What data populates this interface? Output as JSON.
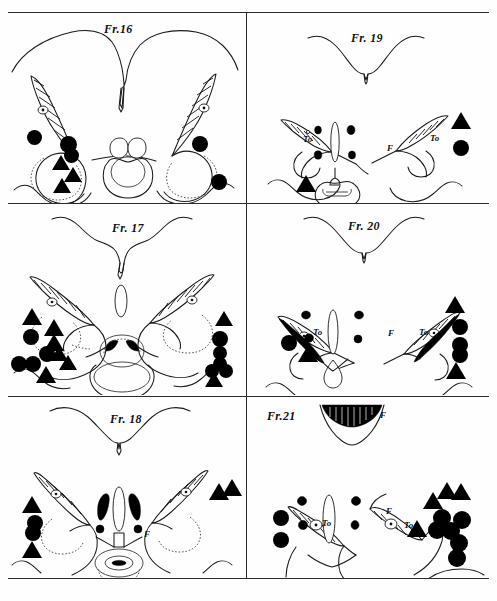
{
  "figure": {
    "title_implicit": "",
    "layout": {
      "columns": 2,
      "rows": 3,
      "width": 497,
      "height": 601
    },
    "colors": {
      "ink": "#1a1a1a",
      "marker": "#000000",
      "paper": "#fefefe"
    }
  },
  "panels": [
    {
      "id": "fr16",
      "title": "Fr.16",
      "title_x": 104,
      "title_y": 22,
      "structure_labels": [],
      "markers": [
        {
          "type": "circle",
          "x": 34,
          "y": 137,
          "r": 7.5
        },
        {
          "type": "circle",
          "x": 68,
          "y": 144,
          "r": 8.5
        },
        {
          "type": "circle",
          "x": 71,
          "y": 155,
          "r": 7.5
        },
        {
          "type": "triangle",
          "x": 61,
          "y": 164,
          "s": 9
        },
        {
          "type": "triangle",
          "x": 73,
          "y": 176,
          "s": 9
        },
        {
          "type": "triangle",
          "x": 62,
          "y": 187,
          "s": 9
        },
        {
          "type": "circle",
          "x": 200,
          "y": 144,
          "r": 8
        },
        {
          "type": "circle",
          "x": 219,
          "y": 182,
          "r": 8
        }
      ]
    },
    {
      "id": "fr19",
      "title": "Fr. 19",
      "title_x": 357,
      "title_y": 32,
      "structure_labels": [
        {
          "text": "To",
          "x": 303,
          "y": 134
        },
        {
          "text": "To",
          "x": 430,
          "y": 133
        },
        {
          "text": "F",
          "x": 387,
          "y": 143
        }
      ],
      "markers": [
        {
          "type": "triangle",
          "x": 306,
          "y": 185,
          "s": 10
        },
        {
          "type": "triangle",
          "x": 461,
          "y": 122,
          "s": 10
        },
        {
          "type": "circle",
          "x": 461,
          "y": 148,
          "r": 8
        }
      ]
    },
    {
      "id": "fr17",
      "title": "Fr. 17",
      "title_x": 112,
      "title_y": 226,
      "structure_labels": [],
      "markers": [
        {
          "type": "triangle",
          "x": 32,
          "y": 318,
          "s": 10
        },
        {
          "type": "triangle",
          "x": 54,
          "y": 329,
          "s": 10
        },
        {
          "type": "circle",
          "x": 31,
          "y": 337,
          "r": 8
        },
        {
          "type": "triangle",
          "x": 54,
          "y": 344,
          "s": 10
        },
        {
          "type": "circle",
          "x": 47,
          "y": 354,
          "r": 8
        },
        {
          "type": "triangle",
          "x": 59,
          "y": 355,
          "s": 9
        },
        {
          "type": "circle",
          "x": 19,
          "y": 364,
          "r": 8
        },
        {
          "type": "circle",
          "x": 33,
          "y": 364,
          "r": 8
        },
        {
          "type": "triangle",
          "x": 68,
          "y": 364,
          "s": 9
        },
        {
          "type": "triangle",
          "x": 46,
          "y": 376,
          "s": 10
        },
        {
          "type": "triangle",
          "x": 224,
          "y": 320,
          "s": 9
        },
        {
          "type": "circle",
          "x": 220,
          "y": 339,
          "r": 8
        },
        {
          "type": "circle",
          "x": 220,
          "y": 353,
          "r": 7
        },
        {
          "type": "circle",
          "x": 220,
          "y": 364,
          "r": 7
        },
        {
          "type": "circle",
          "x": 212,
          "y": 371,
          "r": 7
        },
        {
          "type": "circle",
          "x": 226,
          "y": 371,
          "r": 7
        },
        {
          "type": "triangle",
          "x": 214,
          "y": 381,
          "s": 9
        }
      ]
    },
    {
      "id": "fr20",
      "title": "Fr. 20",
      "title_x": 355,
      "title_y": 226,
      "structure_labels": [
        {
          "text": "To",
          "x": 313,
          "y": 327
        },
        {
          "text": "To",
          "x": 419,
          "y": 327
        },
        {
          "text": "F",
          "x": 388,
          "y": 328
        }
      ],
      "markers": [
        {
          "type": "circle",
          "x": 289,
          "y": 343,
          "r": 8
        },
        {
          "type": "triangle",
          "x": 308,
          "y": 355,
          "s": 10
        },
        {
          "type": "triangle",
          "x": 455,
          "y": 306,
          "s": 10
        },
        {
          "type": "circle",
          "x": 460,
          "y": 327,
          "r": 8
        },
        {
          "type": "circle",
          "x": 460,
          "y": 345,
          "r": 8
        },
        {
          "type": "circle",
          "x": 460,
          "y": 355,
          "r": 8
        },
        {
          "type": "triangle",
          "x": 456,
          "y": 372,
          "s": 10
        }
      ]
    },
    {
      "id": "fr18",
      "title": "Fr. 18",
      "title_x": 110,
      "title_y": 412,
      "structure_labels": [
        {
          "text": "F",
          "x": 144,
          "y": 529
        }
      ],
      "markers": [
        {
          "type": "triangle",
          "x": 32,
          "y": 506,
          "s": 10
        },
        {
          "type": "circle",
          "x": 35,
          "y": 523,
          "r": 8
        },
        {
          "type": "circle",
          "x": 33,
          "y": 533,
          "r": 8
        },
        {
          "type": "triangle",
          "x": 32,
          "y": 551,
          "s": 10
        },
        {
          "type": "triangle",
          "x": 219,
          "y": 493,
          "s": 10
        },
        {
          "type": "triangle",
          "x": 232,
          "y": 489,
          "s": 10
        }
      ]
    },
    {
      "id": "fr21",
      "title": "Fr.21",
      "title_x": 267,
      "title_y": 413,
      "structure_labels": [
        {
          "text": "F",
          "x": 380,
          "y": 410
        },
        {
          "text": "To",
          "x": 322,
          "y": 518
        },
        {
          "text": "To",
          "x": 404,
          "y": 520
        },
        {
          "text": "F",
          "x": 386,
          "y": 506
        }
      ],
      "markers": [
        {
          "type": "circle",
          "x": 281,
          "y": 518,
          "r": 8
        },
        {
          "type": "circle",
          "x": 281,
          "y": 540,
          "r": 8
        },
        {
          "type": "triangle",
          "x": 433,
          "y": 502,
          "s": 10
        },
        {
          "type": "triangle",
          "x": 447,
          "y": 492,
          "s": 10
        },
        {
          "type": "triangle",
          "x": 461,
          "y": 493,
          "s": 10
        },
        {
          "type": "circle",
          "x": 442,
          "y": 518,
          "r": 9
        },
        {
          "type": "circle",
          "x": 437,
          "y": 530,
          "r": 9
        },
        {
          "type": "circle",
          "x": 451,
          "y": 531,
          "r": 9
        },
        {
          "type": "circle",
          "x": 462,
          "y": 520,
          "r": 9
        },
        {
          "type": "triangle",
          "x": 417,
          "y": 530,
          "s": 10
        },
        {
          "type": "circle",
          "x": 459,
          "y": 543,
          "r": 9
        },
        {
          "type": "circle",
          "x": 457,
          "y": 558,
          "r": 9
        }
      ]
    }
  ],
  "legend": {
    "circle_meaning": "filled-circle-marker",
    "triangle_meaning": "filled-triangle-marker"
  }
}
